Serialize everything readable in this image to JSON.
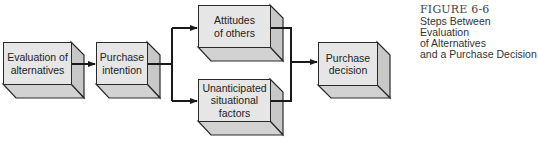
{
  "diagram": {
    "type": "flowchart",
    "nodes": [
      {
        "id": "evaluation",
        "label": "Evaluation of\nalternatives"
      },
      {
        "id": "intention",
        "label": "Purchase\nintention"
      },
      {
        "id": "attitudes",
        "label": "Attitudes\nof others"
      },
      {
        "id": "unanticipated",
        "label": "Unanticipated\nsituational\nfactors"
      },
      {
        "id": "decision",
        "label": "Purchase\ndecision"
      }
    ],
    "edges": [
      {
        "from": "evaluation",
        "to": "intention"
      },
      {
        "from": "intention",
        "to": "attitudes"
      },
      {
        "from": "intention",
        "to": "unanticipated"
      },
      {
        "from": "attitudes",
        "to": "decision"
      },
      {
        "from": "unanticipated",
        "to": "decision"
      }
    ]
  },
  "caption": {
    "figure_number": "FIGURE 6-6",
    "lines": [
      "Steps Between Evaluation",
      "of Alternatives",
      "and a Purchase Decision"
    ]
  },
  "colors": {
    "box_face": "#e6e6e6",
    "box_side": "#c8c8c8",
    "box_bottom": "#d2d2d2",
    "line": "#1a1a1a"
  }
}
